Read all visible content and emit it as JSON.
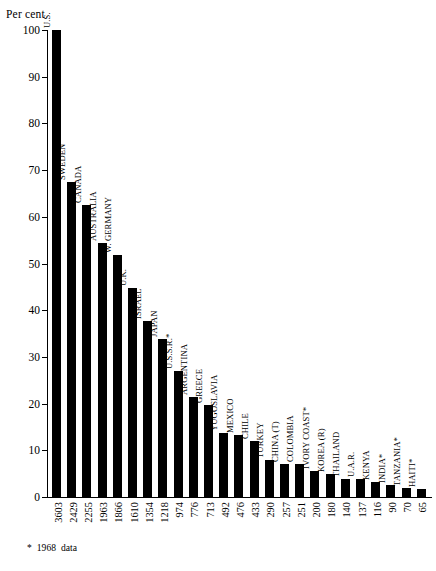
{
  "chart_data": {
    "type": "bar",
    "title": "",
    "xlabel": "",
    "ylabel": "Per cent",
    "ylim": [
      0,
      100
    ],
    "yticks": [
      0,
      10,
      20,
      30,
      40,
      50,
      60,
      70,
      80,
      90,
      100
    ],
    "grid": false,
    "legend": null,
    "bar_color": "#000000",
    "background_color": "#ffffff",
    "categories": [
      "U.S.",
      "SWEDEN",
      "CANADA",
      "AUSTRALIA",
      "W. GERMANY",
      "U.K.",
      "ISRAEL",
      "JAPAN",
      "U.S.S.R.*",
      "ARGENTINA",
      "GREECE",
      "YUGOSLAVIA",
      "MEXICO",
      "CHILE",
      "TURKEY",
      "CHINA (T)",
      "COLOMBIA",
      "IVORY COAST*",
      "KOREA (R)",
      "THAILAND",
      "U.A.R.",
      "KENYA",
      "INDIA*",
      "TANZANIA*",
      "HAITI*"
    ],
    "data_labels": [
      "3603",
      "2429",
      "2255",
      "1963",
      "1866",
      "1610",
      "1354",
      "1218",
      "974",
      "776",
      "713",
      "492",
      "476",
      "433",
      "290",
      "257",
      "251",
      "200",
      "180",
      "140",
      "137",
      "116",
      "90",
      "70",
      "65"
    ],
    "raw_values": [
      3603,
      2429,
      2255,
      1963,
      1866,
      1610,
      1354,
      1218,
      974,
      776,
      713,
      492,
      476,
      433,
      290,
      257,
      251,
      200,
      180,
      140,
      137,
      116,
      90,
      70,
      65
    ],
    "values": [
      100.0,
      67.4,
      62.6,
      54.5,
      51.8,
      44.7,
      37.6,
      33.8,
      27.0,
      21.5,
      19.8,
      13.7,
      13.2,
      12.0,
      8.0,
      7.1,
      7.0,
      5.6,
      5.0,
      3.9,
      3.8,
      3.2,
      2.5,
      1.9,
      1.8
    ],
    "annotations": [
      {
        "id": "footnote",
        "star": "*",
        "year": "1968",
        "word": "data"
      }
    ]
  }
}
